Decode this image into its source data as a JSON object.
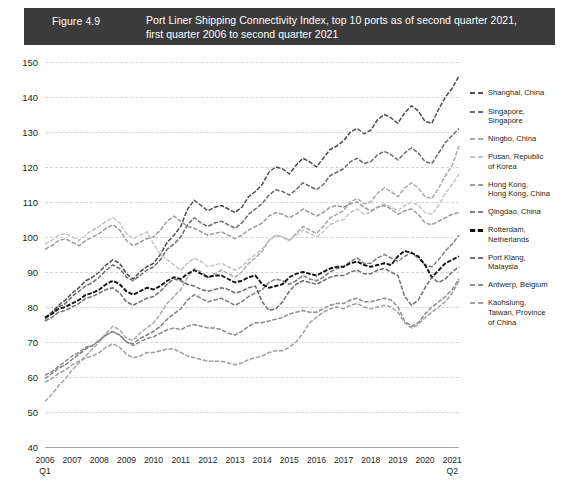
{
  "title": {
    "figure_number": "Figure 4.9",
    "lines": [
      "Port Liner Shipping Connectivity Index, top 10 ports as of second quarter 2021,",
      "first quarter 2006 to second quarter 2021"
    ],
    "bar_color": "#3b3b3b",
    "text_color": "#ffffff"
  },
  "axes": {
    "y_ticks": [
      150,
      140,
      130,
      120,
      110,
      100,
      90,
      80,
      70,
      60,
      50,
      40
    ],
    "x_ticks": [
      "2006",
      "2007",
      "2008",
      "2009",
      "2010",
      "2011",
      "2012",
      "2013",
      "2014",
      "2015",
      "2016",
      "2017",
      "2018",
      "2019",
      "2020",
      "2021"
    ],
    "x_first_quarter": "Q1",
    "x_last_quarter": "Q2",
    "grid_color": "#cfd6dd",
    "axis_color": "#9aa3ab"
  },
  "legend": {
    "items": [
      {
        "label": "Shanghai, China",
        "color": "#4c4c4c"
      },
      {
        "label": "Singapore,\nSingapore",
        "color": "#6b6b6b"
      },
      {
        "label": "Ningbo, China",
        "color": "#a8a8a8"
      },
      {
        "label": "Pusan, Republic\nof Korea",
        "color": "#c4c4c4"
      },
      {
        "label": "Hong Kong,\nHong Kong, China",
        "color": "#9a9a9a"
      },
      {
        "label": "Qingdao, China",
        "color": "#7f7f7f"
      },
      {
        "label": "Rotterdam,\nNetherlands",
        "color": "#111111"
      },
      {
        "label": "Port Klang,\nMalaysia",
        "color": "#6e6e6e"
      },
      {
        "label": "Antwerp, Belgium",
        "color": "#8c8c8c"
      },
      {
        "label": "Kaohsiung,\nTaiwan, Province\nof China",
        "color": "#9e9e9e"
      }
    ]
  },
  "chart_data": {
    "type": "line",
    "title": "Port Liner Shipping Connectivity Index, top 10 ports as of second quarter 2021, first quarter 2006 to second quarter 2021",
    "xlabel": "",
    "ylabel": "",
    "ylim": [
      40,
      150
    ],
    "ytick_step": 10,
    "grid": true,
    "legend_position": "right",
    "x": [
      "2006Q1",
      "2006Q2",
      "2006Q3",
      "2006Q4",
      "2007Q1",
      "2007Q2",
      "2007Q3",
      "2007Q4",
      "2008Q1",
      "2008Q2",
      "2008Q3",
      "2008Q4",
      "2009Q1",
      "2009Q2",
      "2009Q3",
      "2009Q4",
      "2010Q1",
      "2010Q2",
      "2010Q3",
      "2010Q4",
      "2011Q1",
      "2011Q2",
      "2011Q3",
      "2011Q4",
      "2012Q1",
      "2012Q2",
      "2012Q3",
      "2012Q4",
      "2013Q1",
      "2013Q2",
      "2013Q3",
      "2013Q4",
      "2014Q1",
      "2014Q2",
      "2014Q3",
      "2014Q4",
      "2015Q1",
      "2015Q2",
      "2015Q3",
      "2015Q4",
      "2016Q1",
      "2016Q2",
      "2016Q3",
      "2016Q4",
      "2017Q1",
      "2017Q2",
      "2017Q3",
      "2017Q4",
      "2018Q1",
      "2018Q2",
      "2018Q3",
      "2018Q4",
      "2019Q1",
      "2019Q2",
      "2019Q3",
      "2019Q4",
      "2020Q1",
      "2020Q2",
      "2020Q3",
      "2020Q4",
      "2021Q1",
      "2021Q2"
    ],
    "series": [
      {
        "name": "Shanghai, China",
        "color": "#4c4c4c",
        "values": [
          77.0,
          78.5,
          80.5,
          82.0,
          84.0,
          85.5,
          87.5,
          88.5,
          90.0,
          92.0,
          93.5,
          92.5,
          89.5,
          88.0,
          90.0,
          91.5,
          92.5,
          95.0,
          98.5,
          100.5,
          103.0,
          108.0,
          110.5,
          109.0,
          107.5,
          108.5,
          109.0,
          108.0,
          107.0,
          108.5,
          111.5,
          113.0,
          115.0,
          118.5,
          120.0,
          119.5,
          118.0,
          120.5,
          122.5,
          121.5,
          120.0,
          122.5,
          125.0,
          126.0,
          127.5,
          130.0,
          131.0,
          129.5,
          130.5,
          133.5,
          135.0,
          134.0,
          132.5,
          135.5,
          137.5,
          136.0,
          133.0,
          132.5,
          136.5,
          140.0,
          142.5,
          146.0
        ]
      },
      {
        "name": "Singapore, Singapore",
        "color": "#6b6b6b",
        "values": [
          76.5,
          78.0,
          80.0,
          81.0,
          83.0,
          84.5,
          86.0,
          87.0,
          88.5,
          90.5,
          92.0,
          91.0,
          88.5,
          87.5,
          89.0,
          90.5,
          91.5,
          93.5,
          96.5,
          98.0,
          100.0,
          103.5,
          105.5,
          104.0,
          103.0,
          104.0,
          104.5,
          103.5,
          102.5,
          104.0,
          106.5,
          108.0,
          109.5,
          112.0,
          113.5,
          113.0,
          112.0,
          113.5,
          115.5,
          114.5,
          113.5,
          115.0,
          117.5,
          118.5,
          119.5,
          121.5,
          122.5,
          121.0,
          121.5,
          123.5,
          124.5,
          123.5,
          122.0,
          124.0,
          125.5,
          124.0,
          121.5,
          121.0,
          124.0,
          127.0,
          129.0,
          131.0
        ]
      },
      {
        "name": "Ningbo, China",
        "color": "#a8a8a8",
        "values": [
          53.0,
          55.0,
          57.5,
          59.5,
          62.0,
          64.0,
          66.0,
          68.0,
          70.0,
          72.5,
          74.5,
          73.5,
          71.0,
          70.5,
          72.5,
          74.0,
          75.5,
          78.0,
          81.0,
          83.0,
          85.0,
          88.5,
          91.0,
          90.0,
          88.5,
          89.5,
          90.5,
          89.5,
          88.5,
          90.0,
          92.5,
          94.0,
          96.0,
          99.0,
          100.5,
          100.0,
          99.0,
          101.0,
          103.0,
          102.0,
          101.0,
          103.0,
          105.5,
          106.5,
          107.5,
          110.0,
          111.0,
          109.5,
          110.0,
          112.5,
          114.0,
          113.0,
          111.5,
          114.0,
          115.5,
          114.0,
          111.5,
          111.0,
          114.0,
          117.5,
          120.5,
          126.0
        ]
      },
      {
        "name": "Pusan, Republic of Korea",
        "color": "#c4c4c4",
        "values": [
          98.0,
          99.0,
          100.5,
          101.0,
          100.0,
          99.0,
          100.5,
          102.0,
          103.0,
          104.5,
          105.5,
          104.0,
          101.0,
          99.5,
          100.5,
          101.5,
          98.0,
          95.0,
          93.5,
          92.0,
          90.5,
          92.5,
          94.0,
          93.0,
          91.5,
          92.0,
          92.5,
          91.5,
          90.5,
          91.5,
          93.5,
          95.0,
          96.5,
          99.0,
          100.5,
          100.0,
          99.0,
          100.5,
          102.0,
          101.0,
          100.0,
          101.5,
          103.5,
          104.5,
          105.0,
          107.0,
          108.0,
          106.5,
          107.0,
          108.5,
          109.5,
          108.5,
          107.5,
          109.0,
          110.0,
          109.0,
          107.0,
          106.5,
          109.0,
          112.5,
          115.0,
          118.0
        ]
      },
      {
        "name": "Hong Kong, Hong Kong, China",
        "color": "#9a9a9a",
        "values": [
          96.5,
          97.5,
          99.0,
          99.5,
          98.5,
          97.5,
          99.0,
          100.0,
          101.0,
          102.5,
          103.5,
          102.0,
          99.0,
          97.5,
          98.5,
          99.5,
          100.0,
          102.0,
          104.5,
          106.0,
          104.5,
          103.0,
          102.5,
          101.5,
          100.5,
          101.0,
          101.5,
          100.5,
          99.5,
          100.5,
          102.0,
          103.0,
          104.0,
          106.0,
          107.0,
          106.5,
          105.5,
          106.5,
          108.0,
          107.0,
          106.0,
          107.0,
          108.5,
          109.0,
          108.5,
          109.5,
          110.0,
          108.5,
          107.5,
          108.5,
          109.0,
          108.0,
          106.5,
          107.5,
          108.0,
          106.5,
          104.0,
          103.5,
          104.5,
          105.5,
          106.5,
          107.0
        ]
      },
      {
        "name": "Qingdao, China",
        "color": "#7f7f7f",
        "values": [
          59.5,
          61.0,
          62.5,
          63.5,
          65.0,
          66.5,
          68.0,
          69.0,
          70.5,
          72.0,
          73.0,
          72.0,
          70.0,
          69.5,
          71.0,
          72.0,
          73.0,
          74.5,
          76.5,
          78.0,
          79.5,
          82.0,
          83.5,
          82.5,
          81.5,
          82.0,
          82.5,
          81.5,
          80.5,
          81.5,
          83.0,
          84.0,
          85.0,
          87.0,
          88.0,
          87.5,
          86.5,
          87.5,
          89.0,
          88.0,
          87.5,
          88.5,
          90.0,
          91.0,
          91.5,
          93.0,
          94.0,
          92.5,
          92.5,
          94.0,
          95.0,
          94.0,
          93.0,
          94.5,
          95.5,
          94.0,
          92.0,
          91.5,
          93.5,
          96.0,
          98.0,
          100.5
        ]
      },
      {
        "name": "Rotterdam, Netherlands",
        "color": "#111111",
        "values": [
          77.0,
          78.0,
          79.5,
          80.0,
          81.0,
          82.0,
          83.5,
          84.0,
          85.0,
          86.5,
          87.5,
          86.5,
          84.5,
          83.5,
          84.5,
          85.5,
          85.0,
          86.0,
          87.5,
          88.5,
          88.0,
          89.5,
          90.5,
          89.5,
          88.5,
          89.0,
          89.0,
          88.0,
          87.0,
          87.5,
          88.5,
          89.0,
          86.5,
          85.5,
          86.0,
          86.5,
          88.5,
          89.5,
          90.0,
          89.5,
          89.0,
          90.0,
          91.0,
          91.5,
          91.5,
          92.5,
          93.0,
          92.0,
          91.5,
          92.0,
          92.5,
          92.0,
          94.5,
          96.0,
          95.5,
          94.5,
          92.0,
          88.5,
          90.5,
          92.5,
          93.5,
          94.5
        ]
      },
      {
        "name": "Port Klang, Malaysia",
        "color": "#6e6e6e",
        "values": [
          76.0,
          77.0,
          78.5,
          79.0,
          80.0,
          81.0,
          82.5,
          83.0,
          84.0,
          85.0,
          85.5,
          84.0,
          81.5,
          80.5,
          81.5,
          82.5,
          83.0,
          84.5,
          86.5,
          88.0,
          87.5,
          86.5,
          86.0,
          85.0,
          84.5,
          85.0,
          85.5,
          85.0,
          84.0,
          84.5,
          85.5,
          86.0,
          81.5,
          79.0,
          79.5,
          81.5,
          84.5,
          86.5,
          87.5,
          87.0,
          86.5,
          87.5,
          88.5,
          89.0,
          89.0,
          90.0,
          90.5,
          89.5,
          89.5,
          90.5,
          91.0,
          90.0,
          89.0,
          83.0,
          80.5,
          82.0,
          85.5,
          88.5,
          87.0,
          88.0,
          90.0,
          91.5
        ]
      },
      {
        "name": "Antwerp, Belgium",
        "color": "#8c8c8c",
        "values": [
          60.5,
          61.5,
          63.0,
          64.5,
          66.0,
          67.0,
          68.5,
          69.0,
          70.5,
          72.0,
          73.0,
          72.0,
          70.0,
          69.0,
          70.0,
          71.0,
          71.5,
          72.5,
          73.5,
          74.0,
          73.5,
          74.5,
          75.0,
          74.5,
          74.0,
          74.0,
          73.5,
          72.5,
          72.0,
          73.0,
          74.5,
          75.5,
          75.5,
          76.0,
          76.5,
          77.0,
          78.0,
          78.5,
          79.0,
          78.5,
          78.5,
          79.5,
          80.5,
          81.0,
          81.0,
          82.0,
          82.5,
          81.5,
          81.5,
          82.0,
          82.5,
          82.0,
          80.0,
          76.0,
          74.5,
          75.5,
          78.0,
          80.0,
          81.5,
          83.0,
          85.0,
          88.0
        ]
      },
      {
        "name": "Kaohsiung, Taiwan, Province of China",
        "color": "#9e9e9e",
        "values": [
          58.5,
          59.5,
          61.0,
          62.0,
          63.5,
          64.5,
          65.5,
          66.0,
          67.0,
          68.5,
          69.5,
          68.5,
          66.5,
          65.5,
          66.0,
          67.0,
          67.0,
          67.5,
          68.0,
          68.0,
          67.0,
          66.0,
          65.5,
          65.0,
          64.5,
          64.5,
          64.5,
          64.0,
          63.5,
          64.0,
          65.0,
          65.5,
          66.0,
          67.0,
          67.5,
          67.5,
          68.5,
          70.0,
          72.5,
          75.5,
          77.0,
          78.5,
          79.5,
          80.0,
          79.5,
          80.5,
          81.0,
          80.0,
          79.5,
          80.0,
          80.5,
          80.0,
          78.5,
          75.5,
          74.0,
          75.0,
          77.0,
          78.5,
          80.0,
          81.5,
          84.0,
          87.5
        ]
      }
    ]
  }
}
